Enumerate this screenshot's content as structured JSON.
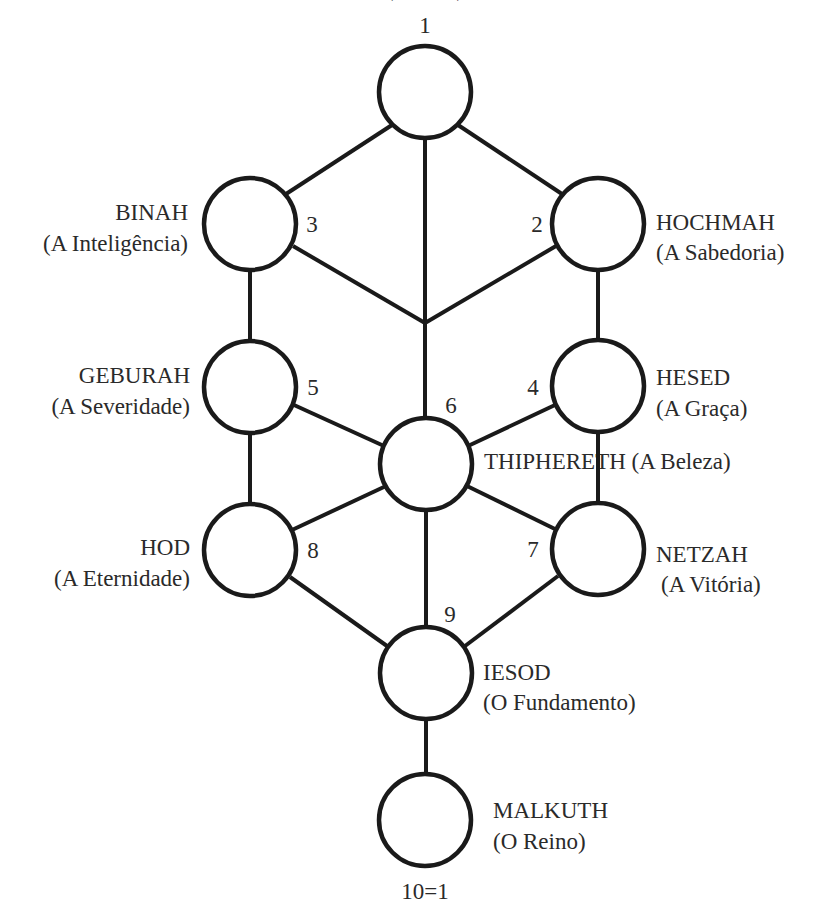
{
  "colors": {
    "stroke": "#1a1a1a",
    "text": "#2a2a2a",
    "background": "#ffffff"
  },
  "top_cut_label": "(. . . . . .)",
  "nodes": [
    {
      "id": "1",
      "number": "1",
      "cx": 425,
      "cy": 92,
      "name": "",
      "meaning": ""
    },
    {
      "id": "2",
      "number": "2",
      "cx": 598,
      "cy": 224,
      "name": "HOCHMAH",
      "meaning": "(A Sabedoria)"
    },
    {
      "id": "3",
      "number": "3",
      "cx": 250,
      "cy": 224,
      "name": "BINAH",
      "meaning": "(A Inteligência)"
    },
    {
      "id": "4",
      "number": "4",
      "cx": 598,
      "cy": 386,
      "name": "HESED",
      "meaning": "(A Graça)"
    },
    {
      "id": "5",
      "number": "5",
      "cx": 250,
      "cy": 387,
      "name": "GEBURAH",
      "meaning": "(A Severidade)"
    },
    {
      "id": "6",
      "number": "6",
      "cx": 426,
      "cy": 464,
      "name": "THIPHERETH",
      "meaning": "(A Beleza)"
    },
    {
      "id": "7",
      "number": "7",
      "cx": 598,
      "cy": 549,
      "name": "NETZAH",
      "meaning": "(A Vitória)"
    },
    {
      "id": "8",
      "number": "8",
      "cx": 250,
      "cy": 550,
      "name": "HOD",
      "meaning": "(A Eternidade)"
    },
    {
      "id": "9",
      "number": "9",
      "cx": 426,
      "cy": 673,
      "name": "IESOD",
      "meaning": "(O Fundamento)"
    },
    {
      "id": "10",
      "number": "10=1",
      "cx": 425,
      "cy": 820,
      "name": "MALKUTH",
      "meaning": "(O Reino)"
    }
  ],
  "labels": {
    "n1": {
      "number": "1"
    },
    "n2": {
      "number": "2",
      "name": "HOCHMAH",
      "meaning": "(A Sabedoria)"
    },
    "n3": {
      "number": "3",
      "name": "BINAH",
      "meaning": "(A Inteligência)"
    },
    "n4": {
      "number": "4",
      "name": "HESED",
      "meaning": "(A Graça)"
    },
    "n5": {
      "number": "5",
      "name": "GEBURAH",
      "meaning": "(A Severidade)"
    },
    "n6": {
      "number": "6",
      "title": "THIPHERETH (A Beleza)"
    },
    "n7": {
      "number": "7",
      "name": "NETZAH",
      "meaning": "(A Vitória)"
    },
    "n8": {
      "number": "8",
      "name": "HOD",
      "meaning": "(A Eternidade)"
    },
    "n9": {
      "number": "9",
      "name": "IESOD",
      "meaning": "(O Fundamento)"
    },
    "n10": {
      "number": "10=1",
      "name": "MALKUTH",
      "meaning": "(O Reino)"
    }
  },
  "edges": [
    [
      "1",
      "3"
    ],
    [
      "1",
      "2"
    ],
    [
      "1",
      "6"
    ],
    [
      "3",
      "junction"
    ],
    [
      "2",
      "junction"
    ],
    [
      "3",
      "5"
    ],
    [
      "2",
      "4"
    ],
    [
      "5",
      "6"
    ],
    [
      "4",
      "6"
    ],
    [
      "5",
      "8"
    ],
    [
      "4",
      "7"
    ],
    [
      "6",
      "8"
    ],
    [
      "6",
      "7"
    ],
    [
      "6",
      "9"
    ],
    [
      "8",
      "9"
    ],
    [
      "7",
      "9"
    ],
    [
      "9",
      "10"
    ]
  ]
}
